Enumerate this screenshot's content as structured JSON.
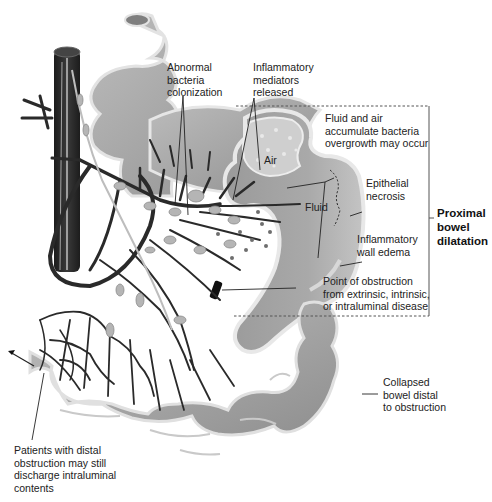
{
  "figure": {
    "type": "anatomical-illustration",
    "colors": {
      "bowel": "#a8a8a8",
      "bowel_dark": "#8c8c8c",
      "bowel_outline": "#e6e6e6",
      "vessel": "#2b2b2b",
      "lymph": "#b9b9b9",
      "bracket": "#555555",
      "obstruction": "#111111"
    }
  },
  "labels": {
    "abnormal_bacteria": "Abnormal\nbacteria\ncolonization",
    "inflammatory_mediators": "Inflammatory\nmediators\nreleased",
    "fluid_air": "Fluid and air\naccumulate bacteria\novergrowth may occur",
    "air": "Air",
    "fluid": "Fluid",
    "epithelial_necrosis": "Epithelial\nnecrosis",
    "proximal_bowel_dilatation": "Proximal\nbowel\ndilatation",
    "inflammatory_wall_edema": "Inflammatory\nwall edema",
    "point_of_obstruction": "Point of obstruction\nfrom extrinsic, intrinsic,\nor intraluminal disease",
    "collapsed_bowel": "Collapsed\nbowel distal\nto obstruction",
    "distal_obstruction": "Patients with distal\nobstruction may still\ndischarge intraluminal\ncontents"
  }
}
